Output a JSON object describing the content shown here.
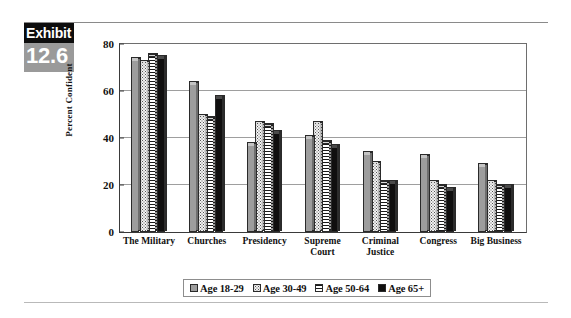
{
  "exhibit": {
    "label": "Exhibit",
    "number": "12.6"
  },
  "chart_data": {
    "type": "bar",
    "title": "",
    "subtitle": "",
    "xlabel": "",
    "ylabel": "Percent Confident",
    "ylim": [
      0,
      80
    ],
    "yticks": [
      0,
      20,
      40,
      60,
      80
    ],
    "ytick_labels": [
      "0",
      "20",
      "40",
      "60",
      "80"
    ],
    "grid": true,
    "grid_axis": "y",
    "legend_position": "bottom",
    "categories": [
      "The Military",
      "Churches",
      "Presidency",
      "Supreme\nCourt",
      "Criminal\nJustice",
      "Congress",
      "Big Business"
    ],
    "series": [
      {
        "name": "Age 18-29",
        "swatch": "solid-gray",
        "color": "#9d9d9d",
        "values": [
          73,
          63,
          37,
          40,
          33,
          32,
          28
        ]
      },
      {
        "name": "Age 30-49",
        "swatch": "dotted",
        "color": "#f2f2f2",
        "values": [
          72,
          49,
          46,
          46,
          29,
          21,
          21
        ]
      },
      {
        "name": "Age 50-64",
        "swatch": "horizontal-stripes",
        "color": "#1a1a1a",
        "values": [
          75,
          48,
          45,
          38,
          21,
          19,
          19
        ]
      },
      {
        "name": "Age 65+",
        "swatch": "solid-black",
        "color": "#100f0f",
        "values": [
          74,
          57,
          42,
          36,
          21,
          18,
          19
        ]
      }
    ]
  }
}
